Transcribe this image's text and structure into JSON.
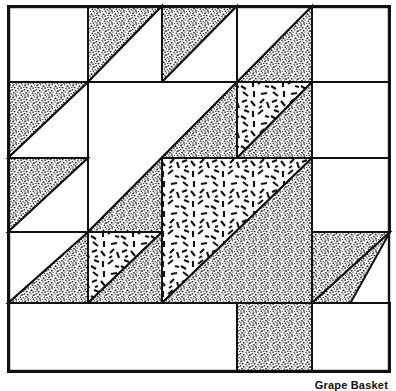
{
  "figure": {
    "title": "Grape Basket",
    "caption": "Grape Basket",
    "kind": "quilt-block-diagram",
    "colors": {
      "background": "#ffffff",
      "outline": "#111111",
      "speckle_fill": "#9a9a9a",
      "dash_fill": "#ffffff",
      "dash_stroke": "#111111"
    },
    "frame": {
      "left": 8,
      "top": 6,
      "right": 390,
      "bottom": 372,
      "stroke_width": 2
    },
    "grid": {
      "columns": [
        8,
        88,
        162,
        237,
        312,
        390
      ],
      "rows": [
        6,
        82,
        158,
        232,
        303,
        372
      ],
      "units": 5
    },
    "patch_legend": [
      {
        "name": "speckle",
        "label": "dark speckled fabric"
      },
      {
        "name": "dash",
        "label": "light dashed print fabric"
      },
      {
        "name": "plain",
        "label": "background / plain white"
      }
    ],
    "patches": [
      {
        "name": "top-left-plain-square",
        "fill": "plain",
        "points": "8,6 88,6 88,82 8,82"
      },
      {
        "name": "top-row-triangle-1",
        "fill": "speckle",
        "points": "88,6 162,6 88,82"
      },
      {
        "name": "top-row-triangle-1-plain",
        "fill": "plain",
        "points": "162,6 162,82 88,82"
      },
      {
        "name": "top-row-triangle-2",
        "fill": "speckle",
        "points": "162,6 237,6 162,82"
      },
      {
        "name": "top-row-triangle-2-plain",
        "fill": "plain",
        "points": "237,6 237,82 162,82"
      },
      {
        "name": "top-row-triangle-3",
        "fill": "speckle",
        "points": "312,6 312,82 237,82"
      },
      {
        "name": "top-row-triangle-3-plain",
        "fill": "plain",
        "points": "237,6 312,6 237,82"
      },
      {
        "name": "top-right-plain-square",
        "fill": "plain",
        "points": "312,6 390,6 390,82 312,82"
      },
      {
        "name": "left-triangle-upper",
        "fill": "speckle",
        "points": "8,82 88,82 8,158"
      },
      {
        "name": "left-triangle-upper-plain",
        "fill": "plain",
        "points": "88,82 88,158 8,158"
      },
      {
        "name": "center-plain-square",
        "fill": "plain",
        "points": "88,82 237,82 88,232"
      },
      {
        "name": "handle-diagonal-band",
        "fill": "speckle",
        "points": "237,82 237,232 88,232"
      },
      {
        "name": "dash-triangle-small-top",
        "fill": "dash",
        "points": "237,82 312,82 237,158"
      },
      {
        "name": "speckle-triangle-right-top",
        "fill": "speckle",
        "points": "312,82 312,158 237,158"
      },
      {
        "name": "right-plain-upper",
        "fill": "plain",
        "points": "312,82 390,82 390,158 312,158"
      },
      {
        "name": "left-triangle-lower",
        "fill": "speckle",
        "points": "8,158 88,158 8,232"
      },
      {
        "name": "left-triangle-lower-plain",
        "fill": "plain",
        "points": "88,158 88,232 8,232"
      },
      {
        "name": "basket-dash-big-triangle",
        "fill": "dash",
        "points": "162,158 312,158 162,303"
      },
      {
        "name": "basket-speckle-big-triangle",
        "fill": "speckle",
        "points": "312,158 312,303 162,303"
      },
      {
        "name": "right-plain-mid",
        "fill": "plain",
        "points": "312,158 390,158 390,232 312,232"
      },
      {
        "name": "lower-left-speckle-triangle",
        "fill": "speckle",
        "points": "88,232 88,303 8,303"
      },
      {
        "name": "lower-left-plain-triangle",
        "fill": "plain",
        "points": "8,232 88,232 8,303"
      },
      {
        "name": "dash-triangle-small-lower",
        "fill": "dash",
        "points": "88,232 162,232 88,303"
      },
      {
        "name": "speckle-triangle-lower-mid",
        "fill": "speckle",
        "points": "162,232 162,303 88,303"
      },
      {
        "name": "foot-right-speckle-triangle",
        "fill": "speckle",
        "points": "312,232 390,232 312,303"
      },
      {
        "name": "foot-bottom-speckle-triangle",
        "fill": "speckle",
        "points": "237,303 312,303 390,232 312,372 237,372"
      },
      {
        "name": "bottom-left-plain",
        "fill": "plain",
        "points": "8,303 237,303 237,372 8,372"
      },
      {
        "name": "bottom-right-plain",
        "fill": "plain",
        "points": "312,303 390,303 390,372 312,372"
      }
    ]
  }
}
